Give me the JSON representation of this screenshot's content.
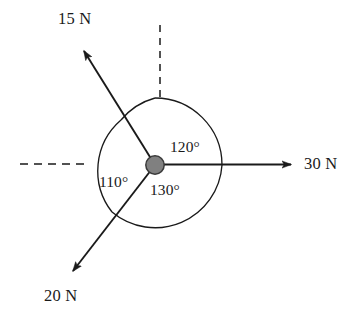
{
  "figure": {
    "kind": "force-vector-diagram",
    "width": 355,
    "height": 317,
    "background_color": "#ffffff",
    "stroke_color": "#1a1a1a",
    "hub_fill_color": "#808080",
    "hub_stroke_color": "#333333"
  },
  "origin": {
    "label": "force-application-point",
    "x": 155,
    "y": 165,
    "radius": 9
  },
  "arc": {
    "radius": 67,
    "stroke_color": "#1a1a1a"
  },
  "reference_axes": [
    {
      "name": "vertical-reference",
      "style": "dashed",
      "from": {
        "x": 160,
        "y": 25
      },
      "to": {
        "x": 160,
        "y": 99
      }
    },
    {
      "name": "horizontal-reference",
      "style": "dashed",
      "from": {
        "x": 20,
        "y": 164
      },
      "to": {
        "x": 89,
        "y": 164
      }
    }
  ],
  "forces": [
    {
      "id": "force-30n",
      "magnitude": 30,
      "unit": "N",
      "label": "30 N",
      "direction_deg": 0,
      "tip": {
        "x": 297,
        "y": 164
      },
      "label_x": 304,
      "label_y": 156
    },
    {
      "id": "force-15n",
      "magnitude": 15,
      "unit": "N",
      "label": "15 N",
      "direction_deg": 120,
      "tip": {
        "x": 78,
        "y": 45
      },
      "label_x": 58,
      "label_y": 11
    },
    {
      "id": "force-20n",
      "magnitude": 20,
      "unit": "N",
      "label": "20 N",
      "direction_deg": 230,
      "tip": {
        "x": 66,
        "y": 278
      },
      "label_x": 44,
      "label_y": 288
    }
  ],
  "angles": [
    {
      "id": "angle-120",
      "label": "120°",
      "value": 120,
      "between": [
        "vertical-reference",
        "force-30n"
      ],
      "label_x": 170,
      "label_y": 139
    },
    {
      "id": "angle-110",
      "label": "110°",
      "value": 110,
      "between": [
        "force-15n",
        "force-20n"
      ],
      "label_x": 99,
      "label_y": 174
    },
    {
      "id": "angle-130",
      "label": "130°",
      "value": 130,
      "between": [
        "force-20n",
        "force-30n"
      ],
      "label_x": 150,
      "label_y": 182
    }
  ]
}
